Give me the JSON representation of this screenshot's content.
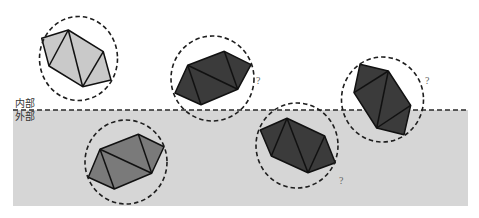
{
  "diagram": {
    "region_labels": {
      "inside": "内部",
      "outside": "外部"
    },
    "colors": {
      "outside_region": "#d6d6d6",
      "shape_light": "#c9c9c9",
      "shape_medium": "#7a7a7a",
      "shape_dark": "#3b3b3b",
      "outline": "#111111"
    },
    "elements": [
      {
        "id": "element-1",
        "shade": "light",
        "region": "inside",
        "annotation": ""
      },
      {
        "id": "element-2",
        "shade": "dark",
        "region": "inside",
        "annotation": "?"
      },
      {
        "id": "element-3",
        "shade": "medium",
        "region": "outside",
        "annotation": ""
      },
      {
        "id": "element-4",
        "shade": "dark",
        "region": "outside",
        "annotation": "?"
      },
      {
        "id": "element-5",
        "shade": "dark",
        "region": "boundary",
        "annotation": "?"
      }
    ]
  }
}
